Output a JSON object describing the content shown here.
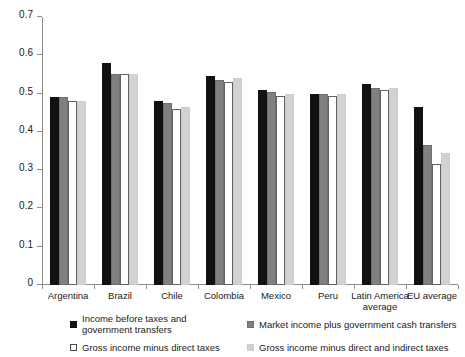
{
  "chart_data": {
    "type": "bar",
    "title": "",
    "subtitle": "",
    "xlabel": "",
    "ylabel": "",
    "ylim": [
      0,
      0.7
    ],
    "ytick_labels": [
      "0",
      "0.1",
      "0.2",
      "0.3",
      "0.4",
      "0.5",
      "0.6",
      "0.7"
    ],
    "ytick_values": [
      0,
      0.1,
      0.2,
      0.3,
      0.4,
      0.5,
      0.6,
      0.7
    ],
    "grid": false,
    "legend_position": "bottom",
    "categories": [
      "Argentina",
      "Brazil",
      "Chile",
      "Colombia",
      "Mexico",
      "Peru",
      "Latin America average",
      "EU average"
    ],
    "series": [
      {
        "name": "Income before taxes and government transfers",
        "color": "#111111",
        "values": [
          0.49,
          0.58,
          0.48,
          0.545,
          0.51,
          0.5,
          0.525,
          0.465
        ]
      },
      {
        "name": "Market income plus government cash transfers",
        "color": "#808080",
        "values": [
          0.49,
          0.55,
          0.475,
          0.535,
          0.505,
          0.5,
          0.515,
          0.365
        ]
      },
      {
        "name": "Gross income minus direct taxes",
        "color": "#ffffff",
        "values": [
          0.48,
          0.55,
          0.46,
          0.53,
          0.495,
          0.495,
          0.51,
          0.315
        ]
      },
      {
        "name": "Gross income minus direct and indirect taxes",
        "color": "#d2d2d2",
        "values": [
          0.48,
          0.55,
          0.465,
          0.54,
          0.5,
          0.5,
          0.515,
          0.345
        ]
      }
    ]
  },
  "legend": {
    "entries": [
      "Income before taxes and government transfers",
      "Market income plus government cash transfers",
      "Gross income minus direct taxes",
      "Gross income minus direct and indirect taxes"
    ]
  }
}
